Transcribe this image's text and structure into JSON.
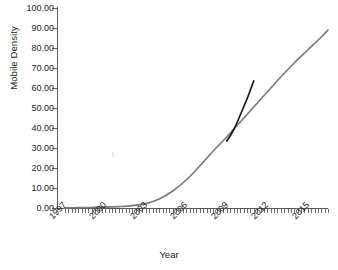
{
  "chart_data": {
    "type": "line",
    "title": "",
    "xlabel": "Year",
    "ylabel": "Mobile Density",
    "xlim": [
      1996.5,
      2016.5
    ],
    "ylim": [
      0,
      100
    ],
    "grid": false,
    "legend": "none",
    "x_tick_labels": [
      "1997",
      "2000",
      "2003",
      "2006",
      "2009",
      "2012",
      "2015"
    ],
    "x_tick_values": [
      1997,
      2000,
      2003,
      2006,
      2009,
      2012,
      2015
    ],
    "y_tick_labels": [
      "0.00",
      "10.00",
      "20.00",
      "30.00",
      "40.00",
      "50.00",
      "60.00",
      "70.00",
      "80.00",
      "90.00",
      "100.00"
    ],
    "y_tick_values": [
      0,
      10,
      20,
      30,
      40,
      50,
      60,
      70,
      80,
      90,
      100
    ],
    "series": [
      {
        "name": "projected-mobile-density",
        "color": "#7a7a7a",
        "x": [
          1997,
          1998,
          1999,
          2000,
          2001,
          2002,
          2003,
          2004,
          2005,
          2006,
          2007,
          2008,
          2009,
          2010,
          2011,
          2012,
          2013,
          2014,
          2015,
          2016,
          2016.5
        ],
        "values": [
          0.1,
          0.15,
          0.25,
          0.4,
          0.7,
          1.2,
          2.2,
          4.5,
          8.5,
          14.0,
          21.0,
          28.5,
          35.5,
          43.0,
          50.5,
          58.0,
          65.5,
          72.5,
          79.0,
          85.5,
          89.0
        ]
      },
      {
        "name": "actual-mobile-density",
        "color": "#1a1a1a",
        "x": [
          2009,
          2009.25,
          2009.5,
          2009.75,
          2010,
          2010.25,
          2010.5,
          2010.75,
          2011
        ],
        "values": [
          33.5,
          36.0,
          39.0,
          42.5,
          46.5,
          50.5,
          54.5,
          59.0,
          63.5
        ]
      }
    ]
  }
}
